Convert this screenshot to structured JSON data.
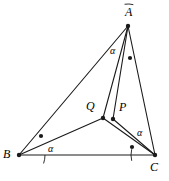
{
  "figure": {
    "type": "geometry-diagram",
    "background_color": "#ffffff",
    "stroke_color": "#1a1a1a",
    "width": 169,
    "height": 181
  },
  "points": [
    {
      "name": "A",
      "label": "A",
      "x": 128,
      "y": 26,
      "label_x": 125,
      "label_y": 6,
      "dot": true
    },
    {
      "name": "B",
      "label": "B",
      "x": 19,
      "y": 155,
      "label_x": 3,
      "label_y": 148,
      "dot": true
    },
    {
      "name": "C",
      "label": "C",
      "x": 155,
      "y": 155,
      "label_x": 150,
      "label_y": 161,
      "dot": true
    },
    {
      "name": "Q",
      "label": "Q",
      "x": 103,
      "y": 118,
      "label_x": 86,
      "label_y": 100,
      "dot": true
    },
    {
      "name": "P",
      "label": "P",
      "x": 113,
      "y": 119,
      "label_x": 119,
      "label_y": 101,
      "dot": true
    }
  ],
  "segments": [
    {
      "name": "AB",
      "from": "A",
      "to": "B"
    },
    {
      "name": "AC",
      "from": "A",
      "to": "C"
    },
    {
      "name": "BC",
      "from": "B",
      "to": "C"
    },
    {
      "name": "AQ",
      "from": "A",
      "to": "Q"
    },
    {
      "name": "AP",
      "from": "A",
      "to": "P"
    },
    {
      "name": "BQ",
      "from": "B",
      "to": "Q"
    },
    {
      "name": "QC",
      "from": "Q",
      "to": "C"
    },
    {
      "name": "PC",
      "from": "P",
      "to": "C"
    }
  ],
  "angle_labels": [
    {
      "name": "alpha-at-A",
      "text": "α",
      "x": 110,
      "y": 46
    },
    {
      "name": "alpha-at-B",
      "text": "α",
      "x": 48,
      "y": 144
    },
    {
      "name": "alpha-at-C",
      "text": "α",
      "x": 137,
      "y": 128
    }
  ],
  "angle_arcs": [
    {
      "name": "arc-at-A",
      "vertex": "A",
      "radius": 22,
      "start_deg": 99,
      "end_deg": 76
    },
    {
      "name": "arc-at-B",
      "vertex": "B",
      "radius": 26,
      "start_deg": 0,
      "end_deg": -19
    },
    {
      "name": "arc-at-C",
      "vertex": "C",
      "radius": 24,
      "start_deg": 194,
      "end_deg": 166
    }
  ],
  "dot_markers": [
    {
      "name": "dot-angle-at-A",
      "x": 130,
      "y": 58
    },
    {
      "name": "dot-angle-at-B",
      "x": 41,
      "y": 136
    },
    {
      "name": "dot-angle-at-C",
      "x": 132,
      "y": 147
    }
  ]
}
